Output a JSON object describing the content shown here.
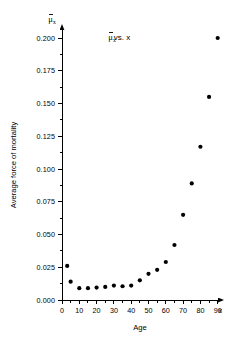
{
  "chart_data": {
    "type": "scatter",
    "title_parts": {
      "symbol": "μ",
      "subscript": "x",
      "rest": "vs.  x"
    },
    "xlabel": "Age",
    "ylabel": "Average force of mortality",
    "x_axis_var": "x",
    "y_axis_var": "μ̄ₓ",
    "xlim": [
      0,
      95
    ],
    "ylim": [
      0.0,
      0.2125
    ],
    "grid": false,
    "legend": null,
    "x_ticks": [
      0,
      10,
      20,
      30,
      40,
      50,
      60,
      70,
      80,
      90
    ],
    "x_tick_labels": [
      "0",
      "10",
      "20",
      "30",
      "40",
      "50",
      "60",
      "70",
      "80",
      "90"
    ],
    "x_minor_ticks": [
      5,
      15,
      25,
      35,
      45,
      55,
      65,
      75,
      85
    ],
    "y_ticks": [
      0.0,
      0.025,
      0.05,
      0.075,
      0.1,
      0.125,
      0.15,
      0.175,
      0.2
    ],
    "y_tick_labels": [
      "0.000",
      "0.025",
      "0.050",
      "0.075",
      "0.100",
      "0.125",
      "0.150",
      "0.175",
      "0.200"
    ],
    "y_minor_ticks": [
      0.0125,
      0.0375,
      0.0625,
      0.0875,
      0.1125,
      0.1375,
      0.1625,
      0.1875
    ],
    "marker": "filled-circle",
    "marker_color": "#000000",
    "marker_size_px": 4.2,
    "x": [
      3,
      5,
      10,
      15,
      20,
      25,
      30,
      35,
      40,
      45,
      50,
      55,
      60,
      65,
      70,
      75,
      80,
      85,
      90
    ],
    "y": [
      0.026,
      0.014,
      0.009,
      0.009,
      0.0095,
      0.01,
      0.011,
      0.0105,
      0.011,
      0.015,
      0.02,
      0.023,
      0.029,
      0.042,
      0.065,
      0.089,
      0.117,
      0.155,
      0.2
    ],
    "points": [
      {
        "x": 3,
        "y": 0.026
      },
      {
        "x": 5,
        "y": 0.014
      },
      {
        "x": 10,
        "y": 0.009
      },
      {
        "x": 15,
        "y": 0.009
      },
      {
        "x": 20,
        "y": 0.0095
      },
      {
        "x": 25,
        "y": 0.01
      },
      {
        "x": 30,
        "y": 0.011
      },
      {
        "x": 35,
        "y": 0.0105
      },
      {
        "x": 40,
        "y": 0.011
      },
      {
        "x": 45,
        "y": 0.015
      },
      {
        "x": 50,
        "y": 0.02
      },
      {
        "x": 55,
        "y": 0.023
      },
      {
        "x": 60,
        "y": 0.029
      },
      {
        "x": 65,
        "y": 0.042
      },
      {
        "x": 70,
        "y": 0.065
      },
      {
        "x": 75,
        "y": 0.089
      },
      {
        "x": 80,
        "y": 0.117
      },
      {
        "x": 85,
        "y": 0.155
      },
      {
        "x": 90,
        "y": 0.2
      }
    ]
  },
  "figure": {
    "background_color": "#ffffff",
    "axis_color": "#000000"
  }
}
